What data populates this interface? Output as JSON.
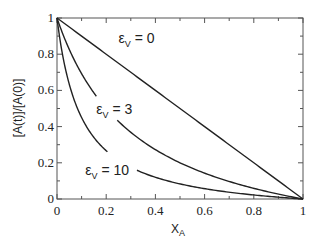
{
  "chart_data": {
    "type": "line",
    "title": "",
    "xlabel": "X_A",
    "xlabel_main": "X",
    "xlabel_sub": "A",
    "ylabel": "[A(t)]/[A(0)]",
    "xlim": [
      0,
      1
    ],
    "ylim": [
      0,
      1
    ],
    "grid": false,
    "legend": "inline labels",
    "x_ticks": [
      "0",
      "0.2",
      "0.4",
      "0.6",
      "0.8",
      "1"
    ],
    "y_ticks": [
      "0",
      "0.2",
      "0.4",
      "0.6",
      "0.8",
      "1"
    ],
    "x": [
      0,
      0.05,
      0.1,
      0.15,
      0.2,
      0.25,
      0.3,
      0.35,
      0.4,
      0.45,
      0.5,
      0.55,
      0.6,
      0.65,
      0.7,
      0.75,
      0.8,
      0.85,
      0.9,
      0.95,
      1.0
    ],
    "series": [
      {
        "name": "εV = 0",
        "label_main": "ε",
        "label_sub": "V",
        "label_rest": " = 0",
        "epsilon": 0,
        "values": [
          1.0,
          0.95,
          0.9,
          0.85,
          0.8,
          0.75,
          0.7,
          0.65,
          0.6,
          0.55,
          0.5,
          0.45,
          0.4,
          0.35,
          0.3,
          0.25,
          0.2,
          0.15,
          0.1,
          0.05,
          0.0
        ],
        "gap": null,
        "label_pos": [
          0.25,
          0.86
        ]
      },
      {
        "name": "εV = 3",
        "label_main": "ε",
        "label_sub": "V",
        "label_rest": " = 3",
        "epsilon": 3,
        "values": [
          1.0,
          0.826,
          0.692,
          0.586,
          0.5,
          0.429,
          0.368,
          0.317,
          0.273,
          0.234,
          0.2,
          0.169,
          0.143,
          0.119,
          0.097,
          0.077,
          0.059,
          0.043,
          0.027,
          0.013,
          0.0
        ],
        "gap": [
          0.16,
          0.245
        ],
        "label_pos": [
          0.16,
          0.47
        ]
      },
      {
        "name": "εV = 10",
        "label_main": "ε",
        "label_sub": "V",
        "label_rest": " = 10",
        "epsilon": 10,
        "values": [
          1.0,
          0.633,
          0.45,
          0.34,
          0.267,
          0.214,
          0.175,
          0.144,
          0.12,
          0.1,
          0.083,
          0.07,
          0.057,
          0.047,
          0.038,
          0.029,
          0.022,
          0.015,
          0.009,
          0.004,
          0.0
        ],
        "gap": [
          0.205,
          0.325
        ],
        "label_pos": [
          0.115,
          0.13
        ]
      }
    ]
  }
}
